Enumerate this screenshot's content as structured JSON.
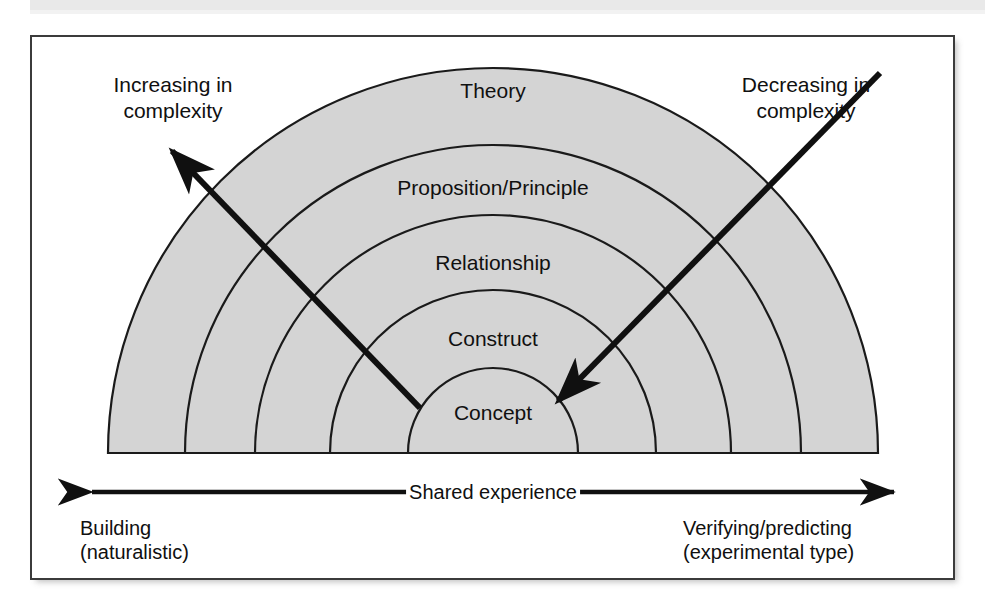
{
  "figure": {
    "type": "concentric-semicircle-hierarchy",
    "fill_color": "#d4d4d4",
    "stroke_color": "#1a1a1a",
    "frame_color": "#3b3b3b",
    "band_color": "#e9e9e9"
  },
  "rings": [
    {
      "id": "theory",
      "label": "Theory",
      "level": 5,
      "radius": 385,
      "label_x": 493,
      "label_y": 78
    },
    {
      "id": "proposition",
      "label": "Proposition/Principle",
      "level": 4,
      "radius": 308,
      "label_x": 493,
      "label_y": 175
    },
    {
      "id": "relationship",
      "label": "Relationship",
      "level": 3,
      "radius": 238,
      "label_x": 493,
      "label_y": 250
    },
    {
      "id": "construct",
      "label": "Construct",
      "level": 2,
      "radius": 163,
      "label_x": 493,
      "label_y": 326
    },
    {
      "id": "concept",
      "label": "Concept",
      "level": 1,
      "radius": 85,
      "label_x": 493,
      "label_y": 400
    }
  ],
  "annotations": {
    "left": {
      "label": "Increasing in\ncomplexity",
      "x": 173,
      "y": 72,
      "arrow": {
        "from_x": 420,
        "from_y": 408,
        "to_x": 168,
        "to_y": 147
      }
    },
    "right": {
      "label": "Decreasing in\ncomplexity",
      "x": 806,
      "y": 72,
      "arrow": {
        "from_x": 880,
        "from_y": 73,
        "to_x": 554,
        "to_y": 405
      }
    }
  },
  "axis": {
    "caption": "Shared experience",
    "caption_x": 493,
    "caption_y": 492,
    "line_y": 492,
    "line_x1": 86,
    "line_x2": 900,
    "left_label": "Building\n(naturalistic)",
    "left_label_x": 80,
    "left_label_y": 516,
    "right_label": "Verifying/predicting\n(experimental type)",
    "right_label_x": 683,
    "right_label_y": 516
  }
}
